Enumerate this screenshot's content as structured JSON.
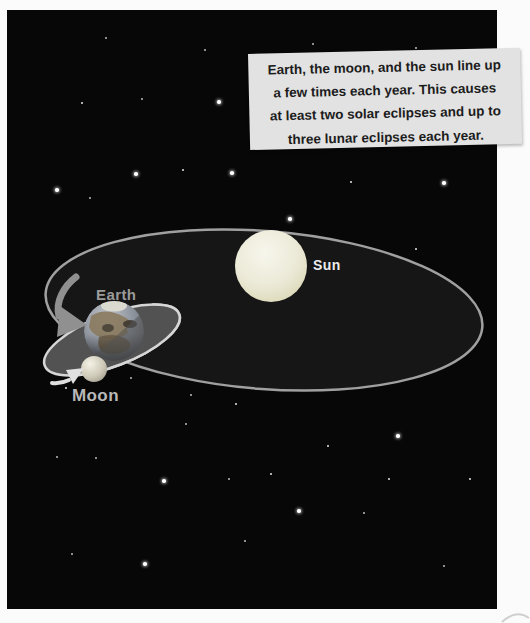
{
  "caption": {
    "lines": [
      "Earth, the moon, and the sun line up",
      "a few times each year. This causes",
      "at least two solar eclipses and up to",
      "three lunar eclipses each year."
    ]
  },
  "labels": {
    "sun": "Sun",
    "earth": "Earth",
    "moon": "Moon"
  },
  "colors": {
    "page_bg": "#fbfbfb",
    "space_bg": "#070707",
    "caption_bg": "#e2e2e2",
    "caption_text": "#1c1c1c",
    "orbit_fill": "#161616",
    "orbit_stroke": "#a0a0a0",
    "moon_orbit_fill": "#525252",
    "moon_orbit_stroke": "#d6d6d6",
    "sun_fill": "#eeedd9",
    "earth_label": "#9b9b9b",
    "sun_label": "#ececec",
    "moon_label": "#b8b8b8",
    "arrow_gray": "#909090",
    "arrow_white": "#e0e0e0"
  },
  "stars": [
    {
      "x": 98,
      "y": 27,
      "s": "d"
    },
    {
      "x": 197,
      "y": 39,
      "s": "d"
    },
    {
      "x": 305,
      "y": 33,
      "s": "d"
    },
    {
      "x": 408,
      "y": 37,
      "s": "d"
    },
    {
      "x": 74,
      "y": 92,
      "s": "m"
    },
    {
      "x": 134,
      "y": 88,
      "s": "d"
    },
    {
      "x": 210,
      "y": 90,
      "s": "b"
    },
    {
      "x": 48,
      "y": 178,
      "s": "b"
    },
    {
      "x": 82,
      "y": 187,
      "s": "d"
    },
    {
      "x": 127,
      "y": 162,
      "s": "b"
    },
    {
      "x": 175,
      "y": 159,
      "s": "m"
    },
    {
      "x": 223,
      "y": 161,
      "s": "b"
    },
    {
      "x": 343,
      "y": 171,
      "s": "m"
    },
    {
      "x": 435,
      "y": 171,
      "s": "b"
    },
    {
      "x": 281,
      "y": 207,
      "s": "b"
    },
    {
      "x": 408,
      "y": 238,
      "s": "m"
    },
    {
      "x": 46,
      "y": 265,
      "s": "m"
    },
    {
      "x": 198,
      "y": 268,
      "s": "d"
    },
    {
      "x": 346,
      "y": 286,
      "s": "d"
    },
    {
      "x": 326,
      "y": 335,
      "s": "b"
    },
    {
      "x": 371,
      "y": 340,
      "s": "d"
    },
    {
      "x": 123,
      "y": 367,
      "s": "d"
    },
    {
      "x": 58,
      "y": 377,
      "s": "m"
    },
    {
      "x": 183,
      "y": 384,
      "s": "d"
    },
    {
      "x": 228,
      "y": 393,
      "s": "m"
    },
    {
      "x": 178,
      "y": 413,
      "s": "d"
    },
    {
      "x": 389,
      "y": 424,
      "s": "b"
    },
    {
      "x": 320,
      "y": 435,
      "s": "m"
    },
    {
      "x": 49,
      "y": 446,
      "s": "d"
    },
    {
      "x": 88,
      "y": 447,
      "s": "d"
    },
    {
      "x": 155,
      "y": 469,
      "s": "b"
    },
    {
      "x": 221,
      "y": 468,
      "s": "d"
    },
    {
      "x": 263,
      "y": 463,
      "s": "m"
    },
    {
      "x": 462,
      "y": 468,
      "s": "m"
    },
    {
      "x": 381,
      "y": 468,
      "s": "m"
    },
    {
      "x": 290,
      "y": 499,
      "s": "b"
    },
    {
      "x": 356,
      "y": 502,
      "s": "d"
    },
    {
      "x": 237,
      "y": 530,
      "s": "d"
    },
    {
      "x": 64,
      "y": 543,
      "s": "d"
    },
    {
      "x": 136,
      "y": 552,
      "s": "b"
    },
    {
      "x": 436,
      "y": 555,
      "s": "d"
    }
  ]
}
